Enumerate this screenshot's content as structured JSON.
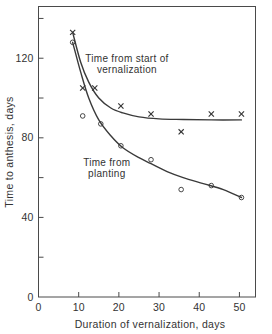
{
  "chart_data": {
    "type": "scatter",
    "title": "",
    "xlabel": "Duration of vernalization, days",
    "ylabel": "Time to anthesis, days",
    "xlim": [
      0,
      54
    ],
    "ylim": [
      0,
      146
    ],
    "xticks": [
      0,
      10,
      20,
      30,
      40,
      50
    ],
    "xticklabels": [
      "0",
      "10",
      "20",
      "30",
      "40",
      "50"
    ],
    "yticks": [
      0,
      20,
      40,
      60,
      80,
      100,
      120,
      140
    ],
    "yticklabels": [
      "0",
      "",
      "40",
      "",
      "80",
      "",
      "120",
      ""
    ],
    "grid": false,
    "legend": "inline-annotations",
    "series": [
      {
        "name": "Time from start of vernalization",
        "marker": "x",
        "x": [
          8.5,
          11.0,
          14.0,
          20.5,
          28.0,
          35.5,
          43.0,
          50.5
        ],
        "y": [
          133,
          105,
          105,
          96,
          92,
          83,
          92,
          92
        ],
        "fit_curve": [
          [
            8.5,
            133
          ],
          [
            10.5,
            118
          ],
          [
            12.5,
            108
          ],
          [
            15.0,
            100
          ],
          [
            18.0,
            95
          ],
          [
            21.0,
            92.5
          ],
          [
            25.0,
            90.5
          ],
          [
            30.0,
            89.5
          ],
          [
            36.0,
            89.2
          ],
          [
            43.0,
            89.0
          ],
          [
            50.5,
            89.0
          ]
        ]
      },
      {
        "name": "Time from planting",
        "marker": "o",
        "x": [
          8.5,
          11.0,
          15.5,
          20.5,
          28.0,
          35.5,
          43.0,
          50.5
        ],
        "y": [
          128,
          91,
          87,
          76,
          69,
          54,
          56,
          50
        ],
        "fit_curve": [
          [
            8.5,
            128
          ],
          [
            10.5,
            113
          ],
          [
            12.5,
            100
          ],
          [
            15.0,
            89
          ],
          [
            18.0,
            81
          ],
          [
            21.0,
            75
          ],
          [
            25.0,
            70
          ],
          [
            28.0,
            67
          ],
          [
            32.0,
            63
          ],
          [
            36.0,
            60
          ],
          [
            41.0,
            57
          ],
          [
            46.0,
            54
          ],
          [
            50.5,
            50
          ]
        ]
      }
    ],
    "annotations": [
      {
        "text_line1": "Time from start of",
        "text_line2": "vernalization",
        "x": 22.0,
        "y": 118
      },
      {
        "text_line1": "Time from",
        "text_line2": "planting",
        "x": 17.0,
        "y": 66
      }
    ]
  },
  "axis": {
    "x_title": "Duration of vernalization, days",
    "y_title": "Time to anthesis, days",
    "x_labels": [
      "0",
      "10",
      "20",
      "30",
      "40",
      "50"
    ],
    "y_labels": [
      "0",
      "40",
      "80",
      "120"
    ]
  },
  "colors": {
    "background": "#ffffff",
    "axis": "#4a4a4a",
    "curve": "#3a3a3a",
    "marker": "#333333",
    "text": "#333333"
  }
}
